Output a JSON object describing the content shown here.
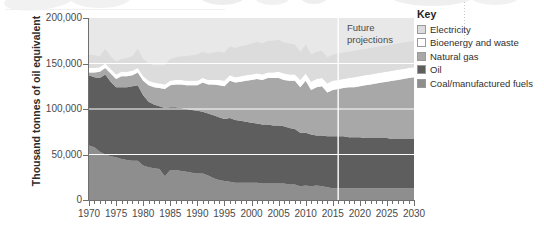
{
  "chart_data": {
    "type": "area",
    "title": "",
    "xlabel": "",
    "ylabel": "Thousand tonnes of oil equivalent",
    "xlim": [
      1970,
      2030
    ],
    "ylim": [
      0,
      200000
    ],
    "ytick_labels": [
      "0",
      "50,000",
      "100,000",
      "150,000",
      "200,000"
    ],
    "ytick_values": [
      0,
      50000,
      100000,
      150000,
      200000
    ],
    "xtick_labels": [
      "1970",
      "1975",
      "1980",
      "1985",
      "1990",
      "1995",
      "2000",
      "2005",
      "2010",
      "2015",
      "2020",
      "2025",
      "2030"
    ],
    "xtick_values": [
      1970,
      1975,
      1980,
      1985,
      1990,
      1995,
      2000,
      2005,
      2010,
      2015,
      2020,
      2025,
      2030
    ],
    "minor_xticks": "every year",
    "grid": "horizontal white gridlines at 50,000 / 100,000 / 150,000",
    "legend_position": "right",
    "stack_order_bottom_to_top": [
      "Coal/manufactured fuels",
      "Oil",
      "Natural gas",
      "Bioenergy and waste",
      "Electricity"
    ],
    "x": [
      1970,
      1971,
      1972,
      1973,
      1974,
      1975,
      1976,
      1977,
      1978,
      1979,
      1980,
      1981,
      1982,
      1983,
      1984,
      1985,
      1986,
      1987,
      1988,
      1989,
      1990,
      1991,
      1992,
      1993,
      1994,
      1995,
      1996,
      1997,
      1998,
      1999,
      2000,
      2001,
      2002,
      2003,
      2004,
      2005,
      2006,
      2007,
      2008,
      2009,
      2010,
      2011,
      2012,
      2013,
      2014,
      2015,
      2016,
      2017,
      2018,
      2019,
      2020,
      2021,
      2022,
      2023,
      2024,
      2025,
      2026,
      2027,
      2028,
      2029,
      2030
    ],
    "series": [
      {
        "name": "Coal/manufactured fuels",
        "color": "#8e8e8e",
        "values": [
          60000,
          58000,
          53000,
          50000,
          48000,
          47000,
          45000,
          44000,
          43000,
          43000,
          38000,
          36000,
          35000,
          34000,
          26000,
          33000,
          33000,
          32000,
          31000,
          30000,
          29000,
          29000,
          27000,
          24000,
          22000,
          21000,
          20000,
          19000,
          19000,
          19000,
          19000,
          19000,
          18000,
          18000,
          18000,
          18000,
          18000,
          17000,
          17000,
          15000,
          16000,
          15000,
          16000,
          15000,
          14000,
          13000,
          13000,
          13000,
          13000,
          13000,
          13000,
          13000,
          13000,
          13000,
          13000,
          13000,
          13000,
          13000,
          13000,
          13000,
          13000
        ]
      },
      {
        "name": "Oil",
        "color": "#5e5e5e",
        "values": [
          137000,
          135000,
          134000,
          138000,
          130000,
          124000,
          124000,
          124000,
          125000,
          126000,
          115000,
          108000,
          105000,
          103000,
          101000,
          102000,
          102000,
          101000,
          100000,
          99000,
          98000,
          97000,
          95000,
          93000,
          91000,
          89000,
          90000,
          88000,
          87000,
          86000,
          85000,
          84000,
          83000,
          83000,
          82000,
          82000,
          81000,
          79000,
          78000,
          74000,
          74000,
          72000,
          71000,
          71000,
          70000,
          70000,
          70000,
          70000,
          69000,
          69000,
          69000,
          68000,
          68000,
          68000,
          68000,
          68000,
          67000,
          67000,
          67000,
          67000,
          67000
        ]
      },
      {
        "name": "Natural gas",
        "color": "#a8a8a8",
        "values": [
          140000,
          140000,
          141000,
          145000,
          139000,
          133000,
          136000,
          136000,
          137000,
          140000,
          131000,
          126000,
          124000,
          123000,
          122000,
          126000,
          127000,
          127000,
          126000,
          126000,
          126000,
          129000,
          127000,
          127000,
          126000,
          125000,
          131000,
          129000,
          130000,
          131000,
          132000,
          133000,
          132000,
          134000,
          134000,
          134000,
          132000,
          131000,
          131000,
          124000,
          131000,
          121000,
          124000,
          125000,
          118000,
          121000,
          122000,
          123000,
          124000,
          124000,
          125000,
          126000,
          127000,
          128000,
          129000,
          130000,
          131000,
          132000,
          133000,
          134000,
          135000
        ]
      },
      {
        "name": "Bioenergy and waste",
        "color": "#ffffff",
        "values": [
          145000,
          145000,
          146000,
          150000,
          144000,
          138000,
          141000,
          141000,
          142000,
          145000,
          136000,
          131000,
          129000,
          128000,
          127000,
          131000,
          132000,
          132000,
          131000,
          131000,
          131000,
          134000,
          132000,
          132000,
          132000,
          131000,
          137000,
          135000,
          136000,
          137000,
          138000,
          139000,
          138000,
          140000,
          140000,
          141000,
          139000,
          138000,
          138000,
          132000,
          139000,
          130000,
          133000,
          134000,
          128000,
          131000,
          132000,
          133000,
          134000,
          135000,
          136000,
          137000,
          138000,
          139000,
          140000,
          141000,
          142000,
          143000,
          144000,
          145000,
          146000
        ]
      },
      {
        "name": "Electricity",
        "color": "#dcdcdc",
        "values": [
          160000,
          159000,
          158000,
          166000,
          158000,
          152000,
          155000,
          156000,
          158000,
          166000,
          155000,
          150000,
          148000,
          148000,
          148000,
          155000,
          157000,
          158000,
          158000,
          159000,
          160000,
          163000,
          161000,
          162000,
          163000,
          162000,
          169000,
          167000,
          169000,
          170000,
          172000,
          174000,
          172000,
          175000,
          175000,
          176000,
          173000,
          172000,
          171000,
          163000,
          171000,
          160000,
          163000,
          164000,
          157000,
          160000,
          161000,
          162000,
          163000,
          164000,
          165000,
          166000,
          167000,
          168000,
          169000,
          170000,
          171000,
          172000,
          173000,
          174000,
          175000
        ]
      }
    ],
    "annotations": [
      {
        "name": "future-projections",
        "text_line1": "Future",
        "text_line2": "projections",
        "at_year": 2016,
        "divider": "vertical white line at 2016"
      }
    ]
  },
  "legend": {
    "title": "Key",
    "items": [
      {
        "label": "Electricity",
        "color": "#dcdcdc"
      },
      {
        "label": "Bioenergy and waste",
        "color": "#ffffff"
      },
      {
        "label": "Natural gas",
        "color": "#a8a8a8"
      },
      {
        "label": "Oil",
        "color": "#5e5e5e"
      },
      {
        "label": "Coal/manufactured fuels",
        "color": "#8e8e8e"
      }
    ]
  }
}
